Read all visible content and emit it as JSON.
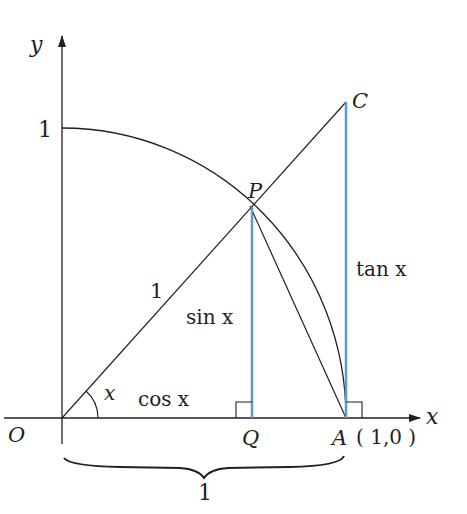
{
  "diagram": {
    "colors": {
      "ink": "#231f20",
      "accent": "#5b9bd5",
      "background": "#ffffff"
    },
    "axes": {
      "x_label": "x",
      "y_label": "y",
      "y_tick_label": "1"
    },
    "points": {
      "O": {
        "label": "O"
      },
      "Q": {
        "label": "Q"
      },
      "A": {
        "label": "A",
        "coords": "( 1,0 )"
      },
      "P": {
        "label": "P"
      },
      "C": {
        "label": "C"
      }
    },
    "segment_labels": {
      "radius": "1",
      "sin": "sin x",
      "cos": "cos x",
      "tan": "tan x",
      "angle": "x",
      "brace": "1"
    }
  }
}
